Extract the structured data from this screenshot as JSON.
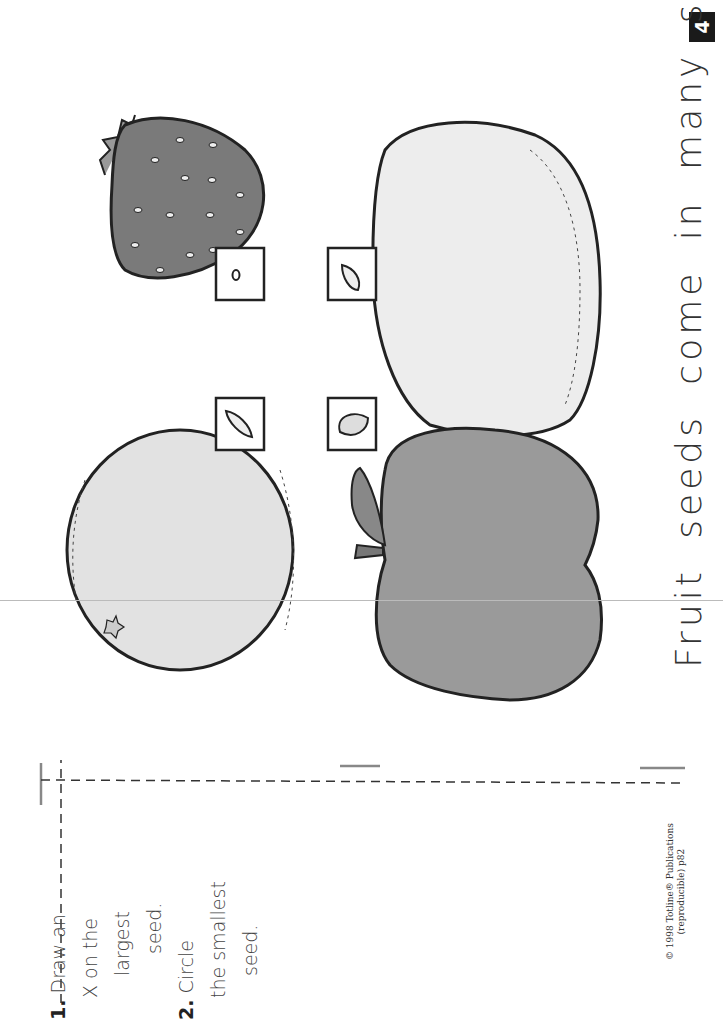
{
  "page": {
    "number": "4",
    "title": "Fruit seeds come in many sizes.",
    "instructions": [
      {
        "num": "1.",
        "lines": [
          "Draw an",
          "X on the",
          "largest",
          "seed."
        ]
      },
      {
        "num": "2.",
        "lines": [
          "Circle",
          "the smallest",
          "seed."
        ]
      }
    ],
    "copyright": [
      "© 1998 Totline® Publications",
      "(reproducible) p82"
    ]
  },
  "fruits": [
    {
      "name": "strawberry",
      "fill": "#7a7a7a"
    },
    {
      "name": "lemon",
      "fill": "#ececec"
    },
    {
      "name": "orange",
      "fill": "#e2e2e2"
    },
    {
      "name": "apple",
      "fill": "#9a9a9a"
    }
  ],
  "seed_boxes": [
    {
      "fruit": "strawberry",
      "size": "tiny"
    },
    {
      "fruit": "lemon",
      "size": "medium"
    },
    {
      "fruit": "orange",
      "size": "medium"
    },
    {
      "fruit": "apple",
      "size": "large"
    }
  ],
  "colors": {
    "ink": "#222222",
    "badge_bg": "#1a1a1a",
    "fold_line": "#888888"
  }
}
